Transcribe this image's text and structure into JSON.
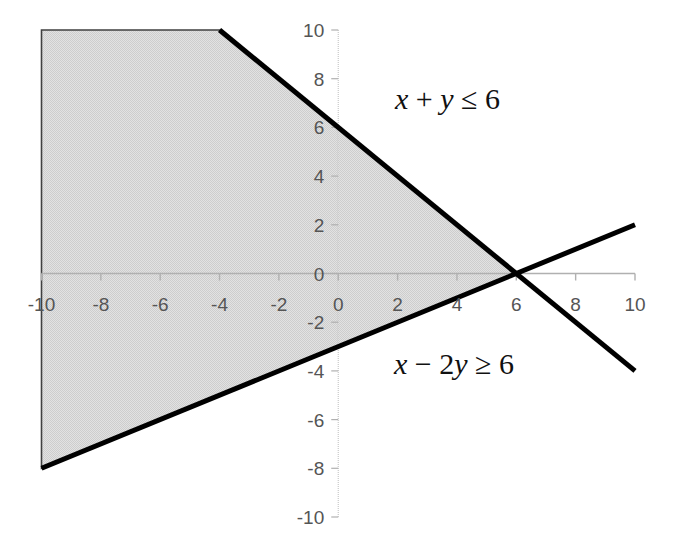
{
  "chart_data": {
    "type": "line",
    "title": "",
    "subtitle": "",
    "xlabel": "",
    "ylabel": "",
    "xlim": [
      -10,
      10
    ],
    "ylim": [
      -10,
      10
    ],
    "grid": false,
    "legend_position": "none",
    "x_ticks": [
      {
        "value": -10,
        "label": "-10"
      },
      {
        "value": -8,
        "label": "-8"
      },
      {
        "value": -6,
        "label": "-6"
      },
      {
        "value": -4,
        "label": "-4"
      },
      {
        "value": -2,
        "label": "-2"
      },
      {
        "value": 0,
        "label": "0"
      },
      {
        "value": 2,
        "label": "2"
      },
      {
        "value": 4,
        "label": "4"
      },
      {
        "value": 6,
        "label": "6"
      },
      {
        "value": 8,
        "label": "8"
      },
      {
        "value": 10,
        "label": "10"
      }
    ],
    "y_ticks": [
      {
        "value": 10,
        "label": "10"
      },
      {
        "value": 8,
        "label": "8"
      },
      {
        "value": 6,
        "label": "6"
      },
      {
        "value": 4,
        "label": "4"
      },
      {
        "value": 2,
        "label": "2"
      },
      {
        "value": 0,
        "label": "0"
      },
      {
        "value": -2,
        "label": "-2"
      },
      {
        "value": -4,
        "label": "-4"
      },
      {
        "value": -6,
        "label": "-6"
      },
      {
        "value": -8,
        "label": "-8"
      },
      {
        "value": -10,
        "label": "-10"
      }
    ],
    "series": [
      {
        "name": "x + y = 6",
        "type": "line",
        "equation": "x + y = 6",
        "slope": -1,
        "intercept": 6,
        "color": "#000000",
        "endpoints": [
          [
            -4.0,
            10.0
          ],
          [
            10.0,
            -4.0
          ]
        ]
      },
      {
        "name": "x - 2y = 6",
        "type": "line",
        "equation": "x - 2y = 6",
        "slope": 0.5,
        "intercept": -3,
        "color": "#000000",
        "endpoints": [
          [
            -10.0,
            -8.0
          ],
          [
            10.0,
            2.0
          ]
        ]
      }
    ],
    "shaded_region": {
      "name": "feasible-region",
      "description": "x + y <= 6 and x - 2y >= 6",
      "fill_color": "#d9d9d9",
      "edge_color": "#404040",
      "vertices": [
        [
          -10,
          10
        ],
        [
          -4,
          10
        ],
        [
          6,
          0
        ],
        [
          -10,
          -8
        ]
      ]
    },
    "annotations": [
      {
        "id": "constraint-1",
        "parts": [
          {
            "text": "x",
            "style": "italic"
          },
          {
            "text": " + ",
            "style": "normal"
          },
          {
            "text": "y",
            "style": "italic"
          },
          {
            "text": " ≤ 6",
            "style": "normal"
          }
        ],
        "plain_text": "x + y ≤ 6",
        "x_px": 395,
        "y_px": 99
      },
      {
        "id": "constraint-2",
        "parts": [
          {
            "text": "x",
            "style": "italic"
          },
          {
            "text": " − 2",
            "style": "normal"
          },
          {
            "text": "y",
            "style": "italic"
          },
          {
            "text": " ≥ 6",
            "style": "normal"
          }
        ],
        "plain_text": "x − 2y ≥ 6",
        "x_px": 394,
        "y_px": 364
      }
    ],
    "axes": {
      "axis_color": "#b0b0b0",
      "tick_label_color": "#555555",
      "x_axis_y_value": 0,
      "y_axis_x_value": 0
    }
  }
}
